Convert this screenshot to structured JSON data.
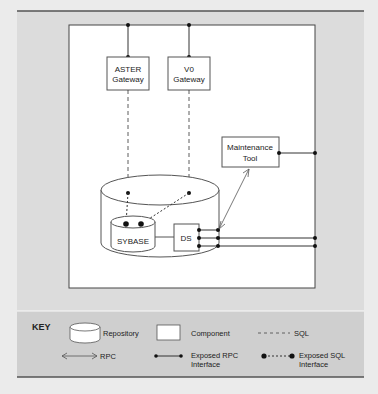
{
  "diagram": {
    "components": {
      "aster_gateway": [
        "ASTER",
        "Gateway"
      ],
      "v0_gateway": [
        "V0",
        "Gateway"
      ],
      "maintenance_tool": [
        "Maintenance",
        "Tool"
      ],
      "sybase": "SYBASE",
      "ds": "DS"
    }
  },
  "key": {
    "title": "KEY",
    "repository": "Repository",
    "component": "Component",
    "sql": "SQL",
    "rpc": "RPC",
    "exposed_rpc": [
      "Exposed RPC",
      "Interface"
    ],
    "exposed_sql": [
      "Exposed SQL",
      "Interface"
    ]
  },
  "colors": {
    "background": "#ebebeb",
    "diagram_bg": "#dcdcdc",
    "key_bg": "#cfcfcf",
    "line": "#333333",
    "box": "#ffffff"
  }
}
